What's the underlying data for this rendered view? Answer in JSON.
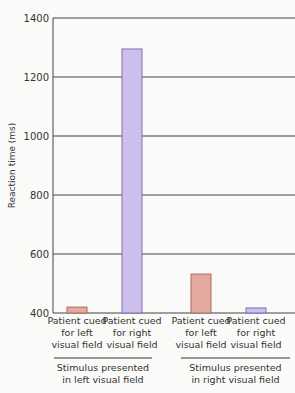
{
  "chart_data": {
    "type": "bar",
    "title": "",
    "xlabel": "",
    "ylabel": "Reaction time (ms)",
    "ylim": [
      400,
      1400
    ],
    "yticks": [
      "400",
      "600",
      "800",
      "1000",
      "1200",
      "1400"
    ],
    "grid": true,
    "categories": [
      {
        "lines": [
          "Patient cued",
          "for left",
          "visual field"
        ],
        "group": 0,
        "value": 420,
        "color": "#e3a99f"
      },
      {
        "lines": [
          "Patient cued",
          "for right",
          "visual field"
        ],
        "group": 0,
        "value": 1295,
        "color": "#cdbfec"
      },
      {
        "lines": [
          "Patient cued",
          "for left",
          "visual field"
        ],
        "group": 1,
        "value": 532,
        "color": "#e3a99f"
      },
      {
        "lines": [
          "Patient cued",
          "for right",
          "visual field"
        ],
        "group": 1,
        "value": 417,
        "color": "#cdbfec"
      }
    ],
    "groups": [
      {
        "lines": [
          "Stimulus presented",
          "in left visual field"
        ]
      },
      {
        "lines": [
          "Stimulus presented",
          "in right visual field"
        ]
      }
    ]
  }
}
